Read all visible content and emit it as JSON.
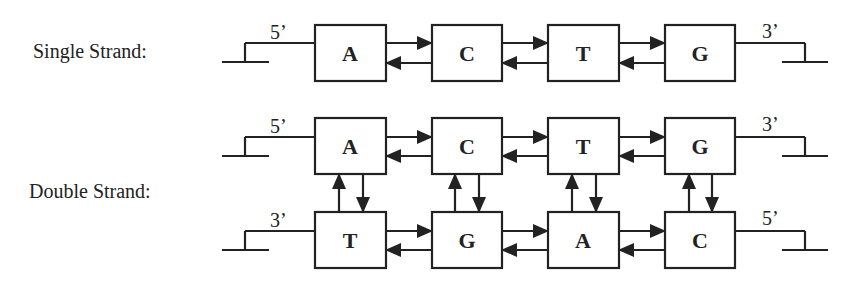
{
  "single_strand": {
    "label": "Single Strand:",
    "start_end": "5’",
    "finish_end": "3’",
    "bases": [
      "A",
      "C",
      "T",
      "G"
    ]
  },
  "double_strand": {
    "label": "Double Strand:",
    "top": {
      "start_end": "5’",
      "finish_end": "3’",
      "bases": [
        "A",
        "C",
        "T",
        "G"
      ]
    },
    "bottom": {
      "start_end": "3’",
      "finish_end": "5’",
      "bases": [
        "T",
        "G",
        "A",
        "C"
      ]
    }
  },
  "colors": {
    "stroke": "#222222",
    "background": "#ffffff"
  }
}
